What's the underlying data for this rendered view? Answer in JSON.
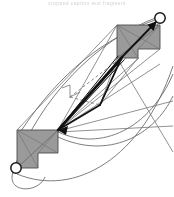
{
  "figure": {
    "width": 174,
    "height": 197,
    "background": "#ffffff",
    "caption_fragment": "cropped caption text fragment"
  },
  "palette": {
    "obstacle_fill": "#9a9a9a",
    "obstacle_stroke": "#4d4d4d",
    "thin_edge": "#6e6e6e",
    "thick_edge": "#111111",
    "dashed_edge": "#777777",
    "curve_edge": "#6e6e6e",
    "node_fill": "#ffffff",
    "node_stroke": "#1a1a1a",
    "background": "#ffffff"
  },
  "nodes": [
    {
      "id": "n-top-right",
      "label": "",
      "cx": 160,
      "cy": 18,
      "r": 5.2,
      "shape": "circle"
    },
    {
      "id": "n-bottom-left",
      "label": "",
      "cx": 16,
      "cy": 168,
      "r": 5.2,
      "shape": "circle"
    }
  ],
  "obstacles": [
    {
      "id": "obstacle-top-right",
      "shape": "L-polygon",
      "fill": "#9a9a9a",
      "points": "117,25 160,25 160,49 138,49 138,58 117,58",
      "diagonals": [
        "117,25 160,49",
        "160,25 117,58",
        "117,25 138,58",
        "160,25 138,49"
      ]
    },
    {
      "id": "obstacle-bottom-left",
      "shape": "L-polygon",
      "fill": "#9a9a9a",
      "points": "17,130 58,130 58,153 38,153 38,168 17,168",
      "diagonals": [
        "17,130 58,153",
        "58,130 17,168",
        "17,130 38,168",
        "58,130 38,153"
      ]
    }
  ],
  "edges": {
    "thick": [
      {
        "id": "edge-thick-spine",
        "from": "58,130",
        "to": "122,57",
        "width": 2.6
      },
      {
        "id": "edge-thick-apex",
        "from": "58,130",
        "to": "100,105",
        "width": 1.9
      },
      {
        "id": "edge-thick-apex-up",
        "from": "100,105",
        "to": "122,57",
        "width": 1.9
      },
      {
        "id": "edge-thick-arrow",
        "from": "122,57",
        "to": "157,21",
        "width": 1.9
      },
      {
        "id": "edge-thick-lower",
        "from": "58,130",
        "to": "122,59",
        "width": 1.4
      }
    ],
    "dashed": [
      {
        "id": "edge-dashed-mid",
        "from": "70,97",
        "to": "100,105"
      },
      {
        "id": "edge-dashed-up",
        "from": "70,97",
        "to": "122,57"
      }
    ],
    "thin": [
      {
        "id": "edge-thin-1",
        "from": "17,130",
        "to": "117,25"
      },
      {
        "id": "edge-thin-2",
        "from": "58,130",
        "to": "117,25"
      },
      {
        "id": "edge-thin-3",
        "from": "58,130",
        "to": "160,25"
      },
      {
        "id": "edge-thin-4",
        "from": "58,130",
        "to": "138,58"
      },
      {
        "id": "edge-thin-5",
        "from": "58,130",
        "to": "160,49"
      },
      {
        "id": "edge-thin-6",
        "from": "58,130",
        "to": "155,72"
      },
      {
        "id": "edge-thin-7",
        "from": "58,130",
        "to": "172,104"
      },
      {
        "id": "edge-thin-8",
        "from": "58,130",
        "to": "172,128"
      },
      {
        "id": "edge-thin-9",
        "from": "70,97",
        "to": "78,93"
      },
      {
        "id": "edge-thin-10",
        "from": "70,97",
        "to": "66,88"
      },
      {
        "id": "edge-thin-11",
        "from": "117,58",
        "to": "172,150"
      },
      {
        "id": "edge-thin-12",
        "from": "117,58",
        "to": "100,105"
      },
      {
        "id": "edge-thin-13",
        "from": "138,58",
        "to": "100,105"
      }
    ],
    "curves": [
      {
        "id": "curve-outer-upper",
        "path": "M 16,163 C 40,100 95,40 158,17"
      },
      {
        "id": "curve-outer-lower",
        "path": "M 17,172 C 70,196 140,160 172,70"
      },
      {
        "id": "curve-mid-a",
        "path": "M 58,132 C 100,150 150,130 172,78"
      },
      {
        "id": "curve-mid-b",
        "path": "M 58,135 C 105,158 152,138 172,92"
      },
      {
        "id": "curve-loop",
        "path": "M 14,173 C 8,192 38,192 44,176"
      },
      {
        "id": "curve-sweep",
        "path": "M 21,131 C 60,72 105,38 155,20"
      }
    ]
  },
  "arrowheads": [
    {
      "id": "arrowhead-top-right",
      "at": "157,21",
      "angle": -45
    },
    {
      "id": "arrowhead-bottom-left",
      "at": "60,129",
      "angle": 135
    }
  ]
}
